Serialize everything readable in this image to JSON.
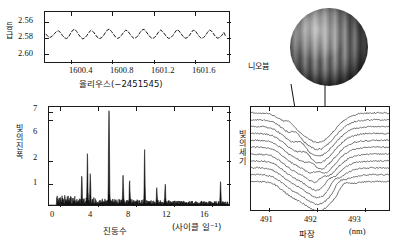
{
  "figure": {
    "title": "",
    "star_label": "니오븀"
  },
  "chart_data": [
    {
      "id": "light_curve",
      "type": "line",
      "title": "",
      "xlabel": "율리우스(−2451545)",
      "ylabel": "등급",
      "xlim": [
        1600.15,
        1601.95
      ],
      "ylim": [
        2.612,
        2.548
      ],
      "y_inverted": true,
      "xticks": [
        1600.4,
        1600.8,
        1601.2,
        1601.6
      ],
      "xtick_labels": [
        "1600.4",
        "1600.8",
        "1601.2",
        "1601.6"
      ],
      "yticks": [
        2.56,
        2.58,
        2.6
      ],
      "ytick_labels": [
        "2.56",
        "2.58",
        "2.60"
      ],
      "grid": false,
      "legend": "none",
      "series": [
        {
          "name": "광도 곡선",
          "x": [
            1600.16,
            1600.18,
            1600.2,
            1600.22,
            1600.24,
            1600.26,
            1600.28,
            1600.3,
            1600.32,
            1600.34,
            1600.36,
            1600.38,
            1600.4,
            1600.42,
            1600.44,
            1600.46,
            1600.48,
            1600.5,
            1600.52,
            1600.54,
            1600.56,
            1600.58,
            1600.6,
            1600.62,
            1600.64,
            1600.66,
            1600.68,
            1600.7,
            1600.72,
            1600.74,
            1600.76,
            1600.78,
            1600.8,
            1600.82,
            1600.84,
            1600.86,
            1600.88,
            1600.9,
            1600.92,
            1600.94,
            1600.96,
            1600.98,
            1601.0,
            1601.02,
            1601.04,
            1601.06,
            1601.08,
            1601.1,
            1601.12,
            1601.14,
            1601.16,
            1601.18,
            1601.2,
            1601.22,
            1601.24,
            1601.26,
            1601.28,
            1601.3,
            1601.32,
            1601.34,
            1601.36,
            1601.38,
            1601.4,
            1601.42,
            1601.44,
            1601.46,
            1601.48,
            1601.5,
            1601.52,
            1601.54,
            1601.56,
            1601.58,
            1601.6,
            1601.62,
            1601.64,
            1601.66,
            1601.68,
            1601.7,
            1601.72,
            1601.74,
            1601.76,
            1601.78,
            1601.8,
            1601.82,
            1601.84,
            1601.86,
            1601.88,
            1601.9,
            1601.92
          ],
          "y": [
            2.5835,
            2.5805,
            2.5795,
            2.581,
            2.584,
            2.5865,
            2.588,
            2.586,
            2.582,
            2.579,
            2.578,
            2.58,
            2.5845,
            2.5885,
            2.59,
            2.587,
            2.583,
            2.5795,
            2.5775,
            2.579,
            2.582,
            2.586,
            2.5885,
            2.587,
            2.5835,
            2.58,
            2.578,
            2.5788,
            2.5815,
            2.5855,
            2.589,
            2.59,
            2.5872,
            2.5835,
            2.58,
            2.5782,
            2.5795,
            2.5825,
            2.5862,
            2.5888,
            2.5875,
            2.584,
            2.5805,
            2.5782,
            2.579,
            2.5818,
            2.5858,
            2.589,
            2.5898,
            2.5868,
            2.583,
            2.5798,
            2.578,
            2.5792,
            2.5822,
            2.5862,
            2.5888,
            2.5872,
            2.5838,
            2.5802,
            2.5782,
            2.579,
            2.5818,
            2.5858,
            2.5892,
            2.588,
            2.5845,
            2.5808,
            2.5785,
            2.579,
            2.5815,
            2.5855,
            2.5888,
            2.5878,
            2.5842,
            2.5805,
            2.5782,
            2.5792,
            2.582,
            2.586,
            2.589,
            2.5875,
            2.5838,
            2.5802,
            2.5785,
            2.5795,
            2.5822,
            2.5858,
            2.58
          ]
        }
      ]
    },
    {
      "id": "periodogram",
      "type": "line",
      "title": "",
      "xlabel": "진동수",
      "xlabel_units": "(사이클 일⁻¹)",
      "ylabel": "빛의 진폭",
      "xlim": [
        -1.2,
        18.0
      ],
      "ylim": [
        0,
        7.6
      ],
      "xticks": [
        0,
        4,
        8,
        12,
        16
      ],
      "xtick_labels": [
        "0",
        "4",
        "8",
        "12",
        "16"
      ],
      "yticks": [
        1,
        2,
        6,
        7
      ],
      "ytick_labels": [
        "1",
        "2",
        "6",
        "7"
      ],
      "grid": false,
      "legend": "none",
      "peaks": [
        {
          "frequency": 5.2,
          "amplitude": 7.25,
          "label": "주 진동수"
        },
        {
          "frequency": 9.0,
          "amplitude": 2.42
        },
        {
          "frequency": 2.9,
          "amplitude": 2.22
        },
        {
          "frequency": 3.2,
          "amplitude": 1.28
        },
        {
          "frequency": 6.7,
          "amplitude": 1.18
        },
        {
          "frequency": 2.3,
          "amplitude": 1.02
        },
        {
          "frequency": 7.4,
          "amplitude": 0.95
        },
        {
          "frequency": 17.1,
          "amplitude": 1.0
        },
        {
          "frequency": 11.2,
          "amplitude": 0.82
        },
        {
          "frequency": 10.3,
          "amplitude": 0.7
        }
      ]
    },
    {
      "id": "line_profiles",
      "type": "line",
      "title": "",
      "xlabel": "파장",
      "xlabel_units": "(nm)",
      "ylabel": "빛의 세기",
      "xlim": [
        490.62,
        493.55
      ],
      "ylim": [
        0,
        1
      ],
      "xticks": [
        491,
        492,
        493
      ],
      "xtick_labels": [
        "491",
        "492",
        "493"
      ],
      "yticks": [],
      "ytick_labels": [],
      "grid": false,
      "legend": "none",
      "n_profiles": 11,
      "description": "시간에 따라 쌓아 올린 흡수선 프로파일",
      "annotations": [
        {
          "type": "arrow",
          "x": 491.72,
          "note": "흡수선 내 이동 성분"
        },
        {
          "type": "arrow",
          "x": 492.22,
          "note": "흡수선 내 이동 성분"
        }
      ]
    }
  ]
}
